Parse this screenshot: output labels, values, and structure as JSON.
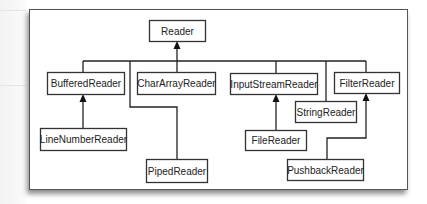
{
  "diagram": {
    "nodes": [
      {
        "id": "reader",
        "label": "Reader",
        "x": 149,
        "y": 20,
        "w": 56,
        "h": 21
      },
      {
        "id": "buffered",
        "label": "BufferedReader",
        "x": 47,
        "y": 72,
        "w": 77,
        "h": 22
      },
      {
        "id": "chararray",
        "label": "CharArrayReader",
        "x": 137,
        "y": 72,
        "w": 78,
        "h": 22
      },
      {
        "id": "inputstream",
        "label": "InputStreamReader",
        "x": 230,
        "y": 73,
        "w": 87,
        "h": 21
      },
      {
        "id": "filter",
        "label": "FilterReader",
        "x": 334,
        "y": 72,
        "w": 65,
        "h": 21
      },
      {
        "id": "string",
        "label": "StringReader",
        "x": 295,
        "y": 101,
        "w": 61,
        "h": 21
      },
      {
        "id": "linenumber",
        "label": "LineNumberReader",
        "x": 40,
        "y": 128,
        "w": 86,
        "h": 22
      },
      {
        "id": "file",
        "label": "FileReader",
        "x": 245,
        "y": 130,
        "w": 61,
        "h": 20
      },
      {
        "id": "piped",
        "label": "PipedReader",
        "x": 146,
        "y": 159,
        "w": 61,
        "h": 23
      },
      {
        "id": "pushback",
        "label": "PushbackReader",
        "x": 287,
        "y": 159,
        "w": 76,
        "h": 21
      }
    ],
    "edges": [
      {
        "from": "bus",
        "to": "reader",
        "points": [
          [
            177,
            61
          ],
          [
            177,
            41
          ]
        ],
        "arrow": true
      },
      {
        "from": "bus",
        "to": "bus",
        "points": [
          [
            83,
            61
          ],
          [
            366,
            61
          ]
        ],
        "arrow": false
      },
      {
        "from": "buffered",
        "to": "bus",
        "points": [
          [
            83,
            72
          ],
          [
            83,
            61
          ]
        ],
        "arrow": false
      },
      {
        "from": "chararray",
        "to": "bus",
        "points": [
          [
            177,
            72
          ],
          [
            177,
            61
          ]
        ],
        "arrow": false
      },
      {
        "from": "inputstream",
        "to": "bus",
        "points": [
          [
            276,
            73
          ],
          [
            276,
            61
          ]
        ],
        "arrow": false
      },
      {
        "from": "filter",
        "to": "bus",
        "points": [
          [
            366,
            72
          ],
          [
            366,
            61
          ]
        ],
        "arrow": false
      },
      {
        "from": "string",
        "to": "bus",
        "points": [
          [
            326,
            101
          ],
          [
            326,
            61
          ]
        ],
        "arrow": false
      },
      {
        "from": "piped",
        "to": "bus",
        "points": [
          [
            177,
            159
          ],
          [
            177,
            107
          ],
          [
            130,
            107
          ],
          [
            130,
            61
          ]
        ],
        "arrow": false
      },
      {
        "from": "linenumber",
        "to": "buffered",
        "points": [
          [
            83,
            128
          ],
          [
            83,
            94
          ]
        ],
        "arrow": true
      },
      {
        "from": "file",
        "to": "inputstream",
        "points": [
          [
            276,
            130
          ],
          [
            276,
            94
          ]
        ],
        "arrow": true
      },
      {
        "from": "pushback",
        "to": "filter",
        "points": [
          [
            327,
            159
          ],
          [
            327,
            138
          ],
          [
            366,
            138
          ],
          [
            366,
            93
          ]
        ],
        "arrow": true
      }
    ]
  }
}
